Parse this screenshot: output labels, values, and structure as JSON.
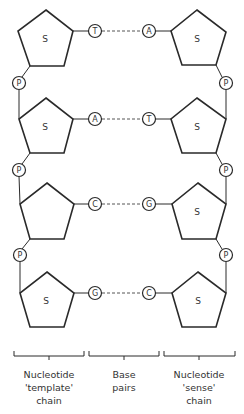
{
  "diagram": {
    "sugar_label": "S",
    "phosphate_label": "P",
    "rows": [
      {
        "left_base": "T",
        "right_base": "A",
        "left_sugar_label": "S",
        "right_sugar_label": "S"
      },
      {
        "left_base": "A",
        "right_base": "T",
        "left_sugar_label": "S",
        "right_sugar_label": "S"
      },
      {
        "left_base": "C",
        "right_base": "G",
        "left_sugar_label": "",
        "right_sugar_label": "S"
      },
      {
        "left_base": "G",
        "right_base": "C",
        "left_sugar_label": "S",
        "right_sugar_label": "S"
      }
    ],
    "brackets": [
      {
        "line1": "Nucleotide",
        "line2": "'template'",
        "line3": "chain"
      },
      {
        "line1": "Base",
        "line2": "pairs",
        "line3": ""
      },
      {
        "line1": "Nucleotide",
        "line2": "'sense'",
        "line3": "chain"
      }
    ],
    "colors": {
      "stroke": "#2a2a2a",
      "dash": "#555555",
      "text": "#333333"
    }
  }
}
